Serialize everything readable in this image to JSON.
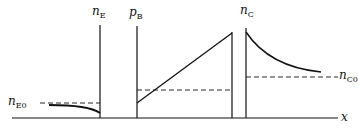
{
  "diagram": {
    "labels": {
      "nE": {
        "main": "n",
        "sub": "E"
      },
      "pB": {
        "main": "p",
        "sub": "B"
      },
      "nC": {
        "main": "n",
        "sub": "C"
      },
      "nE0": {
        "main": "n",
        "sub": "E0"
      },
      "nC0": {
        "main": "n",
        "sub": "C0"
      },
      "x": "x"
    }
  }
}
